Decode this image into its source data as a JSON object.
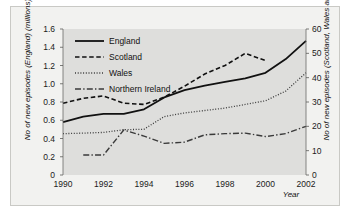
{
  "chart_data": {
    "type": "line",
    "title": "",
    "xlabel": "Year",
    "ylabel_left": "No of new episodes (England) (millions)",
    "ylabel_right": "No of new episodes (Scotland, Wales and Northern Ireland) (thousands)",
    "x": [
      1990,
      1991,
      1992,
      1993,
      1994,
      1995,
      1996,
      1997,
      1998,
      1999,
      2000,
      2001,
      2002
    ],
    "xlim": [
      1990,
      2002
    ],
    "xticks": [
      1990,
      1992,
      1994,
      1996,
      1998,
      2000,
      2002
    ],
    "ylim_left": [
      0,
      1.6
    ],
    "yticks_left": [
      "0",
      "0.2",
      "0.4",
      "0.6",
      "0.8",
      "1.0",
      "1.2",
      "1.4",
      "1.6"
    ],
    "ylim_right": [
      0,
      60
    ],
    "yticks_right": [
      "0",
      "10",
      "20",
      "30",
      "40",
      "50",
      "60"
    ],
    "grid": false,
    "legend_position": "top-left",
    "plot_background": "#dededc",
    "series": [
      {
        "name": "England",
        "axis": "left",
        "style": "solid",
        "color": "#111111",
        "width": 1.8,
        "x": [
          1990,
          1991,
          1992,
          1993,
          1994,
          1995,
          1996,
          1997,
          1998,
          1999,
          2000,
          2001,
          2002
        ],
        "values": [
          0.58,
          0.64,
          0.67,
          0.67,
          0.72,
          0.85,
          0.93,
          0.98,
          1.02,
          1.06,
          1.12,
          1.27,
          1.47
        ]
      },
      {
        "name": "Scotland",
        "axis": "right",
        "style": "dashed",
        "color": "#111111",
        "width": 1.6,
        "x": [
          1990,
          1991,
          1992,
          1993,
          1994,
          1995,
          1996,
          1997,
          1998,
          1999,
          2000
        ],
        "values": [
          29.5,
          31.5,
          32.5,
          29.5,
          29.0,
          32.0,
          36.5,
          41.5,
          45.0,
          50.0,
          47.0
        ]
      },
      {
        "name": "Wales",
        "axis": "right",
        "style": "dotted",
        "color": "#3a3a3a",
        "width": 1.3,
        "x": [
          1990,
          1991,
          1992,
          1993,
          1994,
          1995,
          1996,
          1997,
          1998,
          1999,
          2000,
          2001,
          2002
        ],
        "values": [
          17.0,
          17.2,
          17.5,
          18.6,
          18.8,
          24.0,
          25.5,
          26.5,
          27.5,
          29.0,
          30.5,
          34.5,
          42.0
        ]
      },
      {
        "name": "Northern Ireland",
        "axis": "right",
        "style": "dashdot",
        "color": "#3a3a3a",
        "width": 1.4,
        "x": [
          1991,
          1992,
          1993,
          1994,
          1995,
          1996,
          1997,
          1998,
          1999,
          2000,
          2001,
          2002
        ],
        "values": [
          8.2,
          8.2,
          18.5,
          16.0,
          13.0,
          13.5,
          16.5,
          17.0,
          17.2,
          15.8,
          17.0,
          20.0
        ]
      }
    ]
  },
  "legend": {
    "items": [
      {
        "label": "England"
      },
      {
        "label": "Scotland"
      },
      {
        "label": "Wales"
      },
      {
        "label": "Northern Ireland"
      }
    ]
  }
}
